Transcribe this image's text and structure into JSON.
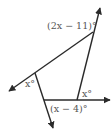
{
  "diagram": {
    "type": "geometry-angles",
    "labels": {
      "top_angle": "(2x − 11)°",
      "left_angle": "x°",
      "right_angle": "x°",
      "bottom_angle": "(x − 4)°"
    },
    "colors": {
      "line": "#2a2a2a",
      "label": "#555555",
      "background": "#ffffff"
    }
  }
}
